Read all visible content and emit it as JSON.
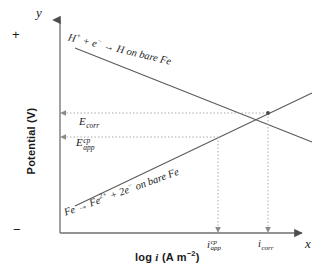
{
  "figure": {
    "kind": "evans-polarization-diagram",
    "axes": {
      "y_letter": "y",
      "x_letter": "x",
      "y_title": "Potential  (V)",
      "x_title_prefix": "log ",
      "x_title_italic": "i",
      "x_title_suffix": " (A m",
      "x_title_exponent": "−2",
      "x_title_close": ")",
      "polarity_positive": "+",
      "polarity_negative": "−"
    },
    "potential_levels": [
      {
        "name": "corrosion-potential",
        "base": "E",
        "sub": "corr",
        "sup": "",
        "y_px": 113
      },
      {
        "name": "applied-cathodic-protection-potential",
        "base": "E",
        "sub": "app",
        "sup": "cp",
        "y_px": 137
      }
    ],
    "current_ticks": [
      {
        "name": "applied-cp-current-density",
        "base": "i",
        "sub": "app",
        "sup": "cp",
        "x_px": 218
      },
      {
        "name": "corrosion-current-density",
        "base": "i",
        "sub": "corr",
        "sup": "",
        "x_px": 268
      }
    ],
    "reactions": [
      {
        "name": "cathodic-hydrogen-reduction",
        "text_html": "H<sup>+</sup> + e<sup>−</sup> → H on bare Fe",
        "plain": "H+ + e- -> H on bare Fe",
        "slope": "negative"
      },
      {
        "name": "anodic-iron-dissolution",
        "text_html": "Fe → Fe<sup>2+</sup> + 2e<sup>−</sup> on bare Fe",
        "plain": "Fe -> Fe2+ + 2e- on bare Fe",
        "slope": "positive"
      }
    ],
    "colors": {
      "ink": "#1a1a1a",
      "line": "#555555",
      "axis": "#777777",
      "guide": "#9a9a9a",
      "background": "#ffffff"
    }
  },
  "chart_data": {
    "type": "line",
    "title": "",
    "xlabel": "log i (A m−2)",
    "ylabel": "Potential (V)",
    "grid": false,
    "legend_position": "inline-labels",
    "annotations": [
      "H+ + e− → H on bare Fe",
      "Fe → Fe2+ + 2e− on bare Fe",
      "Ecorr",
      "Eapp^cp",
      "iapp^cp",
      "icorr"
    ],
    "series": [
      {
        "name": "H+ + e− → H on bare Fe",
        "kind": "cathodic-tafel-branch",
        "x": [
          0.08,
          1.0
        ],
        "y": [
          0.82,
          0.38
        ],
        "x_px": [
          75,
          312
        ],
        "y_px": [
          48,
          142
        ],
        "slope_sign": "negative"
      },
      {
        "name": "Fe → Fe2+ + 2e− on bare Fe",
        "kind": "anodic-tafel-branch",
        "x": [
          0.08,
          1.0
        ],
        "y": [
          0.13,
          0.7
        ],
        "x_px": [
          75,
          312
        ],
        "y_px": [
          206,
          93
        ],
        "slope_sign": "positive"
      }
    ],
    "markers": [
      {
        "name": "corrosion-point",
        "label": "icorr / Ecorr",
        "x_px": 268,
        "y_px": 113
      },
      {
        "name": "applied-cp-point",
        "label": "iapp^cp / Eapp^cp",
        "x_px": 218,
        "y_px": 137
      }
    ],
    "guides": [
      {
        "name": "ecorr-horizontal-guide",
        "orientation": "horizontal",
        "y_px": 113,
        "from_px": 60,
        "to_px": 268
      },
      {
        "name": "eapp-horizontal-guide",
        "orientation": "horizontal",
        "y_px": 137,
        "from_px": 60,
        "to_px": 218
      },
      {
        "name": "icorr-vertical-guide",
        "orientation": "vertical",
        "x_px": 268,
        "from_px": 113,
        "to_px": 233
      },
      {
        "name": "iapp-vertical-guide",
        "orientation": "vertical",
        "x_px": 218,
        "from_px": 137,
        "to_px": 233
      }
    ]
  }
}
